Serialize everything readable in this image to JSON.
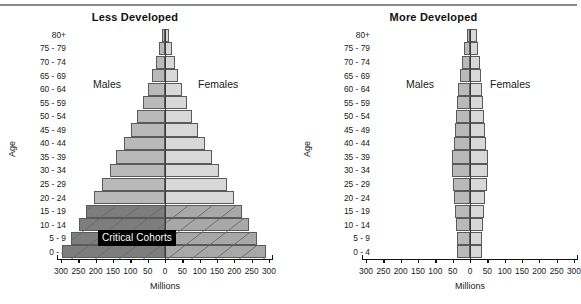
{
  "figure": {
    "millions_axis_label": "Millions",
    "age_axis_label": "Age",
    "critical_badge": "Critical Cohorts",
    "males_label": "Males",
    "females_label": "Females",
    "colors": {
      "male_normal": "#b9b9b9",
      "female_normal": "#d8d8d8",
      "male_critical": "#7d7d7d",
      "female_critical": "#a8a8a8",
      "bar_outline": "#5a5a5a",
      "axis": "#111111",
      "badge_background": "#000000",
      "badge_text": "#ffffff",
      "top_rule": "#8a8a8a"
    }
  },
  "chart_data": [
    {
      "type": "bar",
      "title": "Less Developed",
      "xlabel": "Millions",
      "ylabel": "Age",
      "orientation": "population-pyramid",
      "xlim": [
        -300,
        300
      ],
      "xticks": [
        300,
        250,
        200,
        150,
        100,
        50,
        0,
        50,
        100,
        150,
        200,
        250,
        300
      ],
      "grid": false,
      "legend": [
        "Males",
        "Females"
      ],
      "legend_position": "inside-upper-left / inside-upper-right",
      "categories": [
        "0 - 4",
        "5 - 9",
        "10 - 14",
        "15 - 19",
        "20 - 24",
        "25 - 29",
        "30 - 34",
        "35 - 39",
        "40 - 44",
        "45 - 49",
        "50 - 54",
        "55 - 59",
        "60 - 64",
        "65 - 69",
        "70 - 74",
        "75 - 79",
        "80+"
      ],
      "series": [
        {
          "name": "Males",
          "values": [
            298,
            272,
            248,
            228,
            205,
            182,
            160,
            140,
            118,
            98,
            80,
            64,
            50,
            38,
            27,
            18,
            10
          ]
        },
        {
          "name": "Females",
          "values": [
            292,
            266,
            242,
            222,
            200,
            178,
            156,
            136,
            115,
            96,
            78,
            63,
            50,
            38,
            28,
            19,
            13
          ]
        }
      ],
      "highlighted_categories": [
        "0 - 4",
        "5 - 9",
        "10 - 14",
        "15 - 19"
      ],
      "annotations": [
        "Critical Cohorts"
      ]
    },
    {
      "type": "bar",
      "title": "More Developed",
      "xlabel": "Millions",
      "ylabel": "Age",
      "orientation": "population-pyramid",
      "xlim": [
        -300,
        300
      ],
      "xticks": [
        300,
        250,
        200,
        150,
        100,
        50,
        0,
        50,
        100,
        150,
        200,
        250,
        300
      ],
      "grid": false,
      "legend": [
        "Males",
        "Females"
      ],
      "legend_position": "inside-upper-left / inside-upper-right",
      "categories": [
        "0 - 4",
        "5 - 9",
        "10 - 14",
        "15 - 19",
        "20 - 24",
        "25 - 29",
        "30 - 34",
        "35 - 39",
        "40 - 44",
        "45 - 49",
        "50 - 54",
        "55 - 59",
        "60 - 64",
        "65 - 69",
        "70 - 74",
        "75 - 79",
        "80+"
      ],
      "series": [
        {
          "name": "Males",
          "values": [
            38,
            38,
            40,
            42,
            45,
            50,
            52,
            52,
            46,
            42,
            40,
            38,
            34,
            30,
            24,
            17,
            10
          ]
        },
        {
          "name": "Females",
          "values": [
            36,
            36,
            38,
            40,
            44,
            48,
            51,
            51,
            45,
            42,
            40,
            38,
            35,
            32,
            28,
            22,
            19
          ]
        }
      ],
      "highlighted_categories": [],
      "annotations": []
    }
  ],
  "panels": [
    {
      "id": "less",
      "title": "Less Developed",
      "age_labels": [
        "80+",
        "75 - 79",
        "70 - 74",
        "65 - 69",
        "60 - 64",
        "55 - 59",
        "50 - 54",
        "45 - 49",
        "40 - 44",
        "35 - 39",
        "30 - 34",
        "25 - 29",
        "20 - 24",
        "15 - 19",
        "10 - 14",
        "5 - 9",
        "0 - 4"
      ],
      "xtick_labels": [
        "300",
        "250",
        "200",
        "150",
        "100",
        "50",
        "0",
        "50",
        "100",
        "150",
        "200",
        "250",
        "300"
      ],
      "males_label": "Males",
      "females_label": "Females",
      "axis_title_x": "Millions",
      "axis_title_y": "Age",
      "badge": "Critical Cohorts"
    },
    {
      "id": "more",
      "title": "More Developed",
      "age_labels": [
        "80+",
        "75 - 79",
        "70 - 74",
        "65 - 69",
        "60 - 64",
        "55 - 59",
        "50 - 54",
        "45 - 49",
        "40 - 44",
        "35 - 39",
        "30 - 34",
        "25 - 29",
        "20 - 24",
        "15 - 19",
        "10 - 14",
        "5 - 9",
        "0 - 4"
      ],
      "xtick_labels": [
        "300",
        "250",
        "200",
        "150",
        "100",
        "50",
        "0",
        "50",
        "100",
        "150",
        "200",
        "250",
        "300"
      ],
      "males_label": "Males",
      "females_label": "Females",
      "axis_title_x": "Millions",
      "axis_title_y": "Age",
      "badge": ""
    }
  ]
}
